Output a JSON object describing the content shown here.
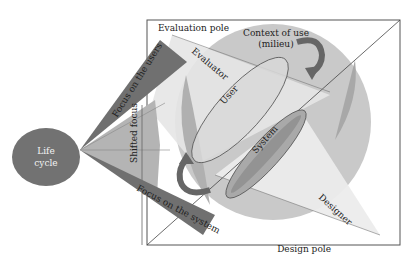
{
  "diagram": {
    "life_cycle": {
      "line1": "Life",
      "line2": "cycle"
    },
    "focus_users": "Focus on the users",
    "shifted_focus": "Shifted focus",
    "focus_system": "Focus on the system",
    "evaluation_pole": "Evaluation pole",
    "design_pole": "Design pole",
    "evaluator": "Evaluator",
    "designer": "Designer",
    "context_of_use": {
      "line1": "Context of use",
      "line2": "(milieu)"
    },
    "user": "User",
    "system": "System"
  },
  "colors": {
    "dark_gray": "#6e6e6e",
    "mid_gray": "#a8a8a8",
    "light_gray": "#c8c8c8",
    "pale_gray": "#e4e4e4",
    "frame": "#555555"
  }
}
